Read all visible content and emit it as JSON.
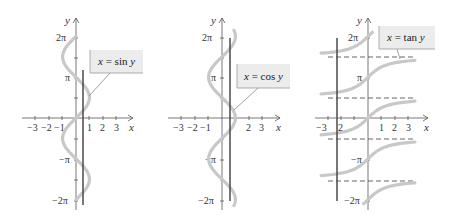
{
  "chart_data": [
    {
      "type": "line",
      "title": "x = sin y",
      "label": "x = sin y",
      "xlabel": "x",
      "ylabel": "y",
      "xlim": [
        -4,
        4
      ],
      "ylim": [
        -6.6,
        7.2
      ],
      "x_ticks": [
        "-3",
        "-2",
        "-1",
        "1",
        "2",
        "3"
      ],
      "y_ticks": [
        "2π",
        "π",
        "−π",
        "−2π"
      ],
      "curve": "x = sin(y), y from -2π to 2π",
      "vertical_line_x": 0.5,
      "grid": false
    },
    {
      "type": "line",
      "title": "x = cos y",
      "label": "x = cos y",
      "xlabel": "x",
      "ylabel": "y",
      "xlim": [
        -4,
        4
      ],
      "ylim": [
        -6.6,
        7.2
      ],
      "x_ticks": [
        "-3",
        "-2",
        "-1",
        "2",
        "3"
      ],
      "y_ticks": [
        "2π",
        "π",
        "−π",
        "−2π"
      ],
      "curve": "x = cos(y), y from -2π to 2π",
      "vertical_line_x": 0.6,
      "grid": false
    },
    {
      "type": "line",
      "title": "x = tan y",
      "label": "x = tan y",
      "xlabel": "x",
      "ylabel": "y",
      "xlim": [
        -4,
        4
      ],
      "ylim": [
        -6.6,
        7.2
      ],
      "x_ticks": [
        "-3",
        "-2",
        "1",
        "2",
        "3"
      ],
      "y_ticks": [
        "2π",
        "π",
        "−π",
        "−2π"
      ],
      "curve": "x = tan(y), branches between asymptotes",
      "asymptotes_y": [
        "3π/2",
        "π/2",
        "−π/2",
        "−3π/2"
      ],
      "vertical_line_x": -2.3,
      "grid": false
    }
  ],
  "panels": [
    {
      "label": "x = sin y",
      "label_parts": {
        "lhs": "x",
        "eq": " = ",
        "fn": "sin ",
        "var": "y"
      },
      "axis_x": "x",
      "axis_y": "y",
      "yticks": {
        "p2": "2π",
        "p1": "π",
        "m1": "−π",
        "m2": "−2π"
      },
      "xticks": {
        "m3": "−3",
        "m2": "−2",
        "m1": "−1",
        "p1": "1",
        "p2": "2",
        "p3": "3"
      }
    },
    {
      "label": "x = cos y",
      "label_parts": {
        "lhs": "x",
        "eq": " = ",
        "fn": "cos ",
        "var": "y"
      },
      "axis_x": "x",
      "axis_y": "y",
      "yticks": {
        "p2": "2π",
        "p1": "π",
        "m1": "−π",
        "m2": "−2π"
      },
      "xticks": {
        "m3": "−3",
        "m2": "−2",
        "m1": "−1",
        "p2": "2",
        "p3": "3"
      }
    },
    {
      "label": "x = tan y",
      "label_parts": {
        "lhs": "x",
        "eq": " = ",
        "fn": "tan ",
        "var": "y"
      },
      "axis_x": "x",
      "axis_y": "y",
      "yticks": {
        "p2": "2π",
        "p1": "π",
        "m1": "−π",
        "m2": "−2π"
      },
      "xticks": {
        "m3": "−3",
        "m2": "2",
        "p1": "1",
        "p2": "2",
        "p3": "3"
      }
    }
  ],
  "colors": {
    "curve": "#c8c8c8",
    "line": "#4a4a4a",
    "axis": "#555555",
    "label_bg": "#ececec"
  }
}
